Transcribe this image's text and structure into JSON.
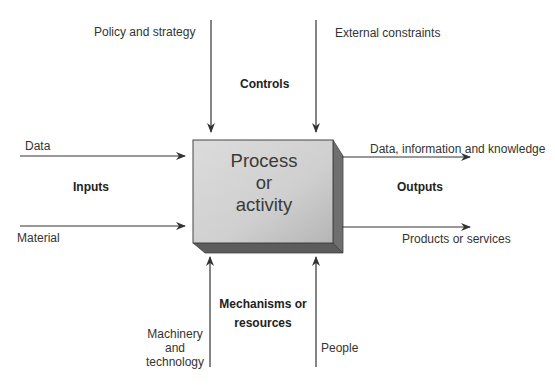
{
  "process": {
    "line1": "Process",
    "line2": "or",
    "line3": "activity"
  },
  "controls": {
    "heading": "Controls",
    "items": [
      "Policy and strategy",
      "External constraints"
    ]
  },
  "inputs": {
    "heading": "Inputs",
    "items": [
      "Data",
      "Material"
    ]
  },
  "outputs": {
    "heading": "Outputs",
    "items": [
      "Data, information and knowledge",
      "Products or services"
    ]
  },
  "mechanisms": {
    "heading_line1": "Mechanisms or",
    "heading_line2": "resources",
    "items": [
      {
        "line1": "Machinery",
        "line2": "and",
        "line3": "technology"
      },
      {
        "line1": "People"
      }
    ]
  },
  "colors": {
    "box_front_light": "#d9d9d9",
    "box_front_dark": "#b8b8b8",
    "box_side": "#6e6e6e",
    "box_bottom": "#5a5a5a",
    "arrow": "#333333"
  }
}
